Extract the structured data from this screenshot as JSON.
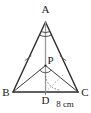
{
  "figure": {
    "kind": "geometry-diagram",
    "background_color": "#ffffff",
    "stroke_color": "#2b2b2b",
    "light_stroke_color": "#9a9a9a",
    "label_color": "#1a1a1a"
  },
  "points": {
    "A": {
      "label": "A",
      "x": 45.5,
      "y": 22.0,
      "label_x": 45.5,
      "label_y": 11.5
    },
    "B": {
      "label": "B",
      "x": 13.0,
      "y": 92.0,
      "label_x": 6.0,
      "label_y": 95.5
    },
    "C": {
      "label": "C",
      "x": 78.0,
      "y": 92.0,
      "label_x": 85.0,
      "label_y": 95.5
    },
    "D": {
      "label": "D",
      "x": 45.5,
      "y": 92.0,
      "label_x": 45.5,
      "label_y": 103.0
    },
    "P": {
      "label": "P",
      "x": 45.5,
      "y": 65.0,
      "label_x": 50.0,
      "label_y": 64.0
    }
  },
  "segments": [
    {
      "name": "AB",
      "from": "A",
      "to": "B",
      "style": "solid",
      "weight": "heavy"
    },
    {
      "name": "AC",
      "from": "A",
      "to": "C",
      "style": "solid",
      "weight": "heavy"
    },
    {
      "name": "BC",
      "from": "B",
      "to": "C",
      "style": "solid",
      "weight": "heavy"
    },
    {
      "name": "AD",
      "from": "A",
      "to": "D",
      "style": "solid",
      "weight": "light"
    },
    {
      "name": "PB",
      "from": "P",
      "to": "B",
      "style": "solid",
      "weight": "medium"
    },
    {
      "name": "PC",
      "from": "P",
      "to": "C",
      "style": "solid",
      "weight": "medium"
    }
  ],
  "marks": {
    "equal_side_ticks": [
      {
        "name": "tick-on-AB",
        "segment": "AB"
      },
      {
        "name": "tick-on-AC",
        "segment": "AC"
      }
    ],
    "apex_angle_arcs": {
      "name": "angle-arcs-at-A",
      "count": 2
    },
    "angle_arc_at_P": {
      "name": "angle-arc-at-P"
    },
    "angle_arc_at_D": {
      "name": "angle-arc-at-D"
    },
    "dotted_ray": {
      "name": "dotted-ray-from-D",
      "style": "dotted"
    }
  },
  "measurements": [
    {
      "name": "base-segment-DC",
      "text": "8 cm",
      "unit": "cm",
      "value": 8,
      "label_x": 64.0,
      "label_y": 106.0
    }
  ]
}
